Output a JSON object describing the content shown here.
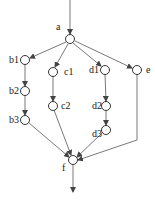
{
  "diagram": {
    "type": "directed-graph",
    "nodes": [
      {
        "id": "a",
        "label": "a",
        "x": 70,
        "y": 39,
        "lx": 56,
        "ly": 30
      },
      {
        "id": "b1",
        "label": "b1",
        "x": 25,
        "y": 60,
        "lx": 9,
        "ly": 63
      },
      {
        "id": "b2",
        "label": "b2",
        "x": 25,
        "y": 91,
        "lx": 9,
        "ly": 94
      },
      {
        "id": "b3",
        "label": "b3",
        "x": 25,
        "y": 120,
        "lx": 9,
        "ly": 123
      },
      {
        "id": "c1",
        "label": "c1",
        "x": 53,
        "y": 72,
        "lx": 64,
        "ly": 75
      },
      {
        "id": "c2",
        "label": "c2",
        "x": 53,
        "y": 106,
        "lx": 61,
        "ly": 109
      },
      {
        "id": "d1",
        "label": "d1",
        "x": 105,
        "y": 70,
        "lx": 89,
        "ly": 73
      },
      {
        "id": "d2",
        "label": "d2",
        "x": 106,
        "y": 106,
        "lx": 92,
        "ly": 109
      },
      {
        "id": "d3",
        "label": "d3",
        "x": 106,
        "y": 130,
        "lx": 92,
        "ly": 137
      },
      {
        "id": "e",
        "label": "e",
        "x": 137,
        "y": 70,
        "lx": 146,
        "ly": 73
      },
      {
        "id": "f",
        "label": "f",
        "x": 73,
        "y": 160,
        "lx": 62,
        "ly": 171
      }
    ],
    "edges": [
      {
        "from": "entry",
        "to": "a",
        "points": [
          [
            70,
            0
          ],
          [
            70,
            34
          ]
        ]
      },
      {
        "from": "a",
        "to": "b1",
        "points": [
          [
            66,
            42
          ],
          [
            30,
            58
          ]
        ]
      },
      {
        "from": "a",
        "to": "c1",
        "points": [
          [
            68,
            44
          ],
          [
            55,
            67
          ]
        ]
      },
      {
        "from": "a",
        "to": "d1",
        "points": [
          [
            73,
            43
          ],
          [
            101,
            66
          ]
        ]
      },
      {
        "from": "a",
        "to": "e",
        "points": [
          [
            75,
            41
          ],
          [
            132,
            68
          ]
        ]
      },
      {
        "from": "b1",
        "to": "b2",
        "points": [
          [
            25,
            64
          ],
          [
            25,
            86
          ]
        ]
      },
      {
        "from": "b2",
        "to": "b3",
        "points": [
          [
            25,
            95
          ],
          [
            25,
            115
          ]
        ]
      },
      {
        "from": "c1",
        "to": "c2",
        "points": [
          [
            53,
            76
          ],
          [
            53,
            101
          ]
        ]
      },
      {
        "from": "d1",
        "to": "d2",
        "points": [
          [
            105,
            74
          ],
          [
            106,
            101
          ]
        ]
      },
      {
        "from": "d2",
        "to": "d3",
        "points": [
          [
            106,
            110
          ],
          [
            106,
            125
          ]
        ]
      },
      {
        "from": "b3",
        "to": "f",
        "points": [
          [
            29,
            123
          ],
          [
            69,
            157
          ]
        ]
      },
      {
        "from": "c2",
        "to": "f",
        "points": [
          [
            54,
            110
          ],
          [
            71,
            155
          ]
        ]
      },
      {
        "from": "d3",
        "to": "f",
        "points": [
          [
            102,
            133
          ],
          [
            77,
            157
          ]
        ]
      },
      {
        "from": "e",
        "to": "f",
        "points": [
          [
            137,
            74
          ],
          [
            137,
            140
          ],
          [
            78,
            160
          ]
        ]
      },
      {
        "from": "f",
        "to": "exit",
        "points": [
          [
            73,
            165
          ],
          [
            73,
            192
          ]
        ]
      }
    ]
  }
}
